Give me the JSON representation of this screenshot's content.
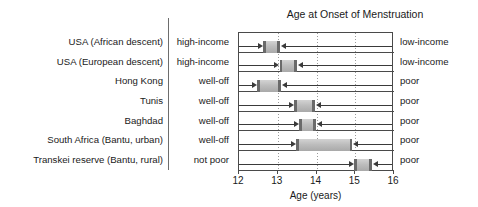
{
  "chart_data": {
    "type": "bar",
    "title": "Age at Onset of Menstruation",
    "xlabel": "Age (years)",
    "ylabel": "",
    "xlim": [
      12,
      16
    ],
    "xticks": [
      12,
      13,
      14,
      15,
      16
    ],
    "xtick_labels": [
      "12",
      "13",
      "14",
      "15",
      "16"
    ],
    "gridlines": [
      13,
      14,
      15
    ],
    "grid": true,
    "legend": "none",
    "orientation": "horizontal",
    "note": "Range bar (dumbbell) chart: each bar spans the mean age at menarche from the wealthier group (left arrow label) to the poorer group (right arrow label).",
    "categories": [
      "USA (African descent)",
      "USA (European descent)",
      "Hong Kong",
      "Tunis",
      "Baghdad",
      "South Africa (Bantu, urban)",
      "Transkei reserve (Bantu, rural)"
    ],
    "rich_labels": [
      "high-income",
      "high-income",
      "well-off",
      "well-off",
      "well-off",
      "well-off",
      "not poor"
    ],
    "poor_labels": [
      "low-income",
      "low-income",
      "poor",
      "poor",
      "poor",
      "poor",
      "poor"
    ],
    "rows": [
      {
        "place": "USA (African descent)",
        "rich_label": "high-income",
        "poor_label": "low-income",
        "start": 12.65,
        "end": 13.08
      },
      {
        "place": "USA (European descent)",
        "rich_label": "high-income",
        "poor_label": "low-income",
        "start": 13.08,
        "end": 13.52
      },
      {
        "place": "Hong Kong",
        "rich_label": "well-off",
        "poor_label": "poor",
        "start": 12.5,
        "end": 13.1
      },
      {
        "place": "Tunis",
        "rich_label": "well-off",
        "poor_label": "poor",
        "start": 13.45,
        "end": 13.98
      },
      {
        "place": "Baghdad",
        "rich_label": "well-off",
        "poor_label": "poor",
        "start": 13.58,
        "end": 14.0
      },
      {
        "place": "South Africa (Bantu, urban)",
        "rich_label": "well-off",
        "poor_label": "poor",
        "start": 13.5,
        "end": 14.95
      },
      {
        "place": "Transkei reserve (Bantu, rural)",
        "rich_label": "not poor",
        "poor_label": "poor",
        "start": 15.0,
        "end": 15.45
      }
    ],
    "series": [
      {
        "name": "Wealthier group age at menarche",
        "values": [
          12.65,
          13.08,
          12.5,
          13.45,
          13.58,
          13.5,
          15.0
        ]
      },
      {
        "name": "Poorer group age at menarche",
        "values": [
          13.08,
          13.52,
          13.1,
          13.98,
          14.0,
          14.95,
          15.45
        ]
      }
    ],
    "colors": {
      "bar_fill": "#bdbdbd",
      "bar_cap": "#6a6a6a",
      "axis": "#4a4a4a",
      "grid": "#9a9a9a",
      "text": "#1a1a1a",
      "background": "#ffffff"
    }
  }
}
